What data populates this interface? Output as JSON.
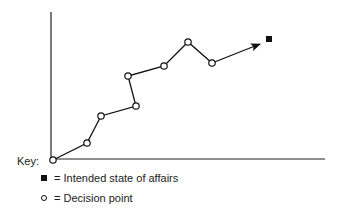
{
  "diagram": {
    "type": "path-to-goal",
    "axes": {
      "x_axis": true,
      "y_axis": true,
      "labels": []
    },
    "decision_points": [
      {
        "x": 53,
        "y": 160
      },
      {
        "x": 87,
        "y": 143
      },
      {
        "x": 101,
        "y": 116
      },
      {
        "x": 136,
        "y": 106
      },
      {
        "x": 128,
        "y": 76
      },
      {
        "x": 164,
        "y": 66
      },
      {
        "x": 188,
        "y": 42
      },
      {
        "x": 212,
        "y": 63
      }
    ],
    "arrow": {
      "from": {
        "x": 212,
        "y": 63
      },
      "to": {
        "x": 260,
        "y": 44
      }
    },
    "goal_marker": {
      "x": 269,
      "y": 39,
      "shape": "filled-square"
    }
  },
  "key": {
    "title": "Key:",
    "items": [
      {
        "symbol": "filled-square",
        "label": "= Intended state of affairs"
      },
      {
        "symbol": "open-circle",
        "label": "= Decision point"
      }
    ]
  }
}
